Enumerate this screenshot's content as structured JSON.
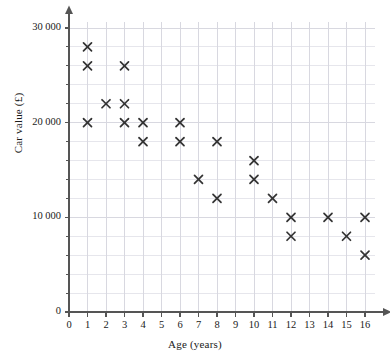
{
  "chart_data": {
    "type": "scatter",
    "title": "",
    "xlabel": "Age (years)",
    "ylabel": "Car value (£)",
    "xlim": [
      0,
      16
    ],
    "ylim": [
      0,
      30000
    ],
    "x_ticks": [
      0,
      1,
      2,
      3,
      4,
      5,
      6,
      7,
      8,
      9,
      10,
      11,
      12,
      13,
      14,
      15,
      16
    ],
    "x_tick_labels": [
      "0",
      "1",
      "2",
      "3",
      "4",
      "5",
      "6",
      "7",
      "8",
      "9",
      "10",
      "11",
      "12",
      "13",
      "14",
      "15",
      "16"
    ],
    "y_ticks": [
      0,
      10000,
      20000,
      30000
    ],
    "y_tick_labels": [
      "0",
      "10 000",
      "20 000",
      "30 000"
    ],
    "y_minor_step": 2000,
    "x_minor_step": 1,
    "grid": true,
    "grid_color": "#d8d8e0",
    "marker": "x",
    "marker_color": "#333333",
    "legend": false,
    "points": [
      {
        "x": 1,
        "y": 28000
      },
      {
        "x": 1,
        "y": 26000
      },
      {
        "x": 1,
        "y": 20000
      },
      {
        "x": 2,
        "y": 22000
      },
      {
        "x": 3,
        "y": 26000
      },
      {
        "x": 3,
        "y": 22000
      },
      {
        "x": 3,
        "y": 20000
      },
      {
        "x": 4,
        "y": 20000
      },
      {
        "x": 4,
        "y": 18000
      },
      {
        "x": 6,
        "y": 20000
      },
      {
        "x": 6,
        "y": 18000
      },
      {
        "x": 7,
        "y": 14000
      },
      {
        "x": 8,
        "y": 18000
      },
      {
        "x": 8,
        "y": 12000
      },
      {
        "x": 10,
        "y": 16000
      },
      {
        "x": 10,
        "y": 14000
      },
      {
        "x": 11,
        "y": 12000
      },
      {
        "x": 12,
        "y": 10000
      },
      {
        "x": 12,
        "y": 8000
      },
      {
        "x": 14,
        "y": 10000
      },
      {
        "x": 15,
        "y": 8000
      },
      {
        "x": 16,
        "y": 10000
      },
      {
        "x": 16,
        "y": 6000
      }
    ]
  },
  "axes": {
    "x_title": "Age (years)",
    "y_title": "Car value (£)"
  }
}
